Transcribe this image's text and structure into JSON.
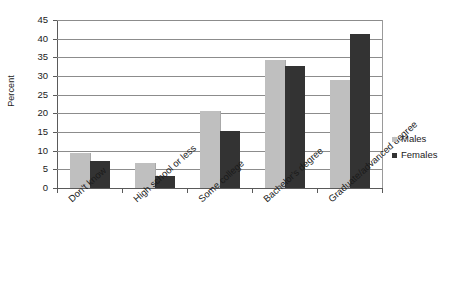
{
  "chart_data": {
    "type": "bar",
    "title": "",
    "xlabel": "",
    "ylabel": "Percent",
    "ylim": [
      0,
      45
    ],
    "ytick_step": 5,
    "yticks": [
      45,
      40,
      35,
      30,
      25,
      20,
      15,
      10,
      5,
      0
    ],
    "grid": true,
    "legend_position": "right",
    "categories": [
      "Don't know",
      "High school or less",
      "Some college",
      "Bachelor's degree",
      "Graduate/advanced degree"
    ],
    "series": [
      {
        "name": "Males",
        "color": "#bfbfbf",
        "values": [
          9.3,
          6.8,
          20.5,
          34.3,
          28.8
        ]
      },
      {
        "name": "Females",
        "color": "#333333",
        "values": [
          7.3,
          3.1,
          15.4,
          32.7,
          41.2
        ]
      }
    ]
  },
  "legend": {
    "items": [
      {
        "label": "Males",
        "swatch": "males-swatch"
      },
      {
        "label": "Females",
        "swatch": "females-swatch"
      }
    ]
  }
}
